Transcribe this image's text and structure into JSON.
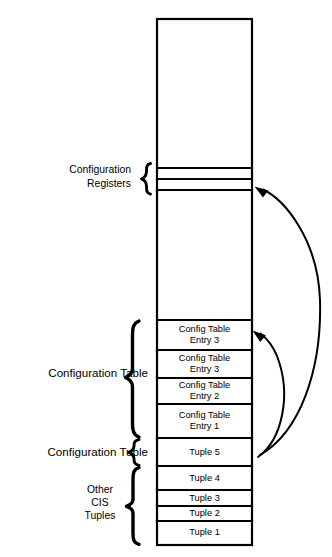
{
  "diagram": {
    "colors": {
      "background": "#ffffff",
      "stroke": "#000000",
      "text": "#000000"
    },
    "memory_column": {
      "name": "attribute-memory-column",
      "top_empty_region_label": "",
      "middle_empty_region_label": ""
    },
    "cells": [
      {
        "id": "config-register-row-1",
        "label": "",
        "y_top": 168,
        "y_bottom": 179
      },
      {
        "id": "config-register-row-2",
        "label": "",
        "y_top": 179,
        "y_bottom": 190
      },
      {
        "id": "config-table-entry-3a",
        "label_line1": "Config Table",
        "label_line2": "Entry 3",
        "y_top": 320,
        "y_bottom": 350
      },
      {
        "id": "config-table-entry-3b",
        "label_line1": "Config Table",
        "label_line2": "Entry 3",
        "y_top": 350,
        "y_bottom": 378
      },
      {
        "id": "config-table-entry-2",
        "label_line1": "Config Table",
        "label_line2": "Entry 2",
        "y_top": 378,
        "y_bottom": 404
      },
      {
        "id": "config-table-entry-1",
        "label_line1": "Config Table",
        "label_line2": "Entry 1",
        "y_top": 404,
        "y_bottom": 438
      },
      {
        "id": "tuple-5",
        "label_line1": "Tuple 5",
        "label_line2": "",
        "y_top": 438,
        "y_bottom": 466
      },
      {
        "id": "tuple-4",
        "label_line1": "Tuple 4",
        "label_line2": "",
        "y_top": 466,
        "y_bottom": 490
      },
      {
        "id": "tuple-3",
        "label_line1": "Tuple 3",
        "label_line2": "",
        "y_top": 490,
        "y_bottom": 506
      },
      {
        "id": "tuple-2",
        "label_line1": "Tuple 2",
        "label_line2": "",
        "y_top": 506,
        "y_bottom": 521
      },
      {
        "id": "tuple-1",
        "label_line1": "Tuple 1",
        "label_line2": "",
        "y_top": 521,
        "y_bottom": 545
      }
    ],
    "group_labels": [
      {
        "id": "configuration-registers",
        "lines": [
          "Configuration",
          "Registers"
        ],
        "align": "right",
        "brace_top": 164,
        "brace_bottom": 194
      },
      {
        "id": "configuration-table",
        "lines": [
          "Configuration Table"
        ],
        "align": "right",
        "brace_top": 320,
        "brace_bottom": 438
      },
      {
        "id": "configuration-tuple",
        "lines": [
          "Configuration Tuple"
        ],
        "align": "right",
        "brace_top": 438,
        "brace_bottom": 466
      },
      {
        "id": "other-cis-tuples",
        "lines": [
          "Other",
          "CIS",
          "Tuples"
        ],
        "align": "center",
        "brace_top": 466,
        "brace_bottom": 545
      }
    ],
    "arrows": [
      {
        "id": "tuple5-to-config-registers",
        "from": "tuple-5",
        "to": "config-register-row-2",
        "direction": "upward-curved"
      },
      {
        "id": "tuple5-to-config-table",
        "from": "tuple-5",
        "to": "config-table-entry-3a",
        "direction": "upward-curved"
      }
    ]
  }
}
